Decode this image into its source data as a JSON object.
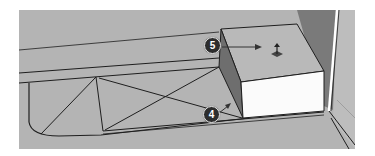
{
  "viewport": {
    "background_color": "#b4b4b4",
    "line_color": "#1e1e1e",
    "box_front_color": "#fbfbfb",
    "box_top_color": "#b8b8b8",
    "box_side_color": "#6e6e6e",
    "wall_color": "#7a7a7a"
  },
  "callouts": [
    {
      "number": "5",
      "target": "push-pull cursor on box top face"
    },
    {
      "number": "4",
      "target": "extruded box side face"
    }
  ],
  "cursor": {
    "icon": "push-pull-icon"
  }
}
